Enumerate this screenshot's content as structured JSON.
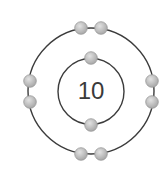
{
  "diagram": {
    "nucleus_label": "10",
    "colors": {
      "shell": "#3c3c3c",
      "electron_fill": "#c4c4c4",
      "electron_stroke": "#9a9a9a",
      "text": "#3a3a3a"
    },
    "shells": [
      {
        "name": "inner-shell",
        "radius": 33,
        "electron_count": 2
      },
      {
        "name": "outer-shell",
        "radius": 63,
        "electron_count": 8
      }
    ],
    "electrons": [
      {
        "shell": 1,
        "x": 91,
        "y": 58
      },
      {
        "shell": 1,
        "x": 91,
        "y": 125
      },
      {
        "shell": 2,
        "x": 81,
        "y": 28
      },
      {
        "shell": 2,
        "x": 101,
        "y": 28
      },
      {
        "shell": 2,
        "x": 30,
        "y": 81
      },
      {
        "shell": 2,
        "x": 30,
        "y": 102
      },
      {
        "shell": 2,
        "x": 152,
        "y": 81
      },
      {
        "shell": 2,
        "x": 152,
        "y": 102
      },
      {
        "shell": 2,
        "x": 81,
        "y": 154
      },
      {
        "shell": 2,
        "x": 101,
        "y": 154
      }
    ]
  }
}
